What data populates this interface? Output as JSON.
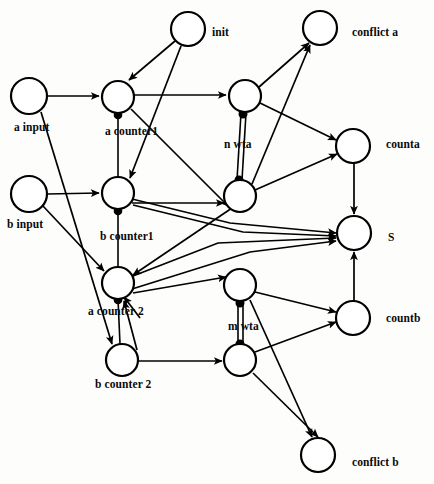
{
  "diagram": {
    "background_color": "#fdfdfb",
    "stroke_color": "#000000",
    "node_fill": "#ffffff",
    "nodes": [
      {
        "id": "a_input",
        "label": "a input",
        "cx": 29,
        "cy": 96,
        "r": 18,
        "label_x": 14,
        "label_y": 122
      },
      {
        "id": "b_input",
        "label": "b input",
        "cx": 29,
        "cy": 194,
        "r": 18,
        "label_x": 7,
        "label_y": 219
      },
      {
        "id": "init",
        "label": "init",
        "cx": 188,
        "cy": 29,
        "r": 17,
        "label_x": 212,
        "label_y": 27
      },
      {
        "id": "a_counter1",
        "label": "a counter1",
        "cx": 118,
        "cy": 97,
        "r": 16,
        "label_x": 105,
        "label_y": 126
      },
      {
        "id": "b_counter1",
        "label": "b counter1",
        "cx": 118,
        "cy": 193,
        "r": 16,
        "label_x": 100,
        "label_y": 231
      },
      {
        "id": "a_counter2",
        "label": "a counter 2",
        "cx": 118,
        "cy": 283,
        "r": 16,
        "label_x": 88,
        "label_y": 306
      },
      {
        "id": "b_counter2",
        "label": "b counter 2",
        "cx": 122,
        "cy": 360,
        "r": 16,
        "label_x": 95,
        "label_y": 379
      },
      {
        "id": "n_wta_top",
        "label": "n wta",
        "cx": 245,
        "cy": 96,
        "r": 16,
        "label_x": 224,
        "label_y": 139
      },
      {
        "id": "n_wta_bot",
        "label": "",
        "cx": 240,
        "cy": 196,
        "r": 16,
        "label_x": 0,
        "label_y": 0
      },
      {
        "id": "m_wta_top",
        "label": "m wta",
        "cx": 240,
        "cy": 285,
        "r": 16,
        "label_x": 228,
        "label_y": 321
      },
      {
        "id": "m_wta_bot",
        "label": "",
        "cx": 240,
        "cy": 360,
        "r": 16,
        "label_x": 0,
        "label_y": 0
      },
      {
        "id": "conflict_a",
        "label": "conflict a",
        "cx": 320,
        "cy": 28,
        "r": 17,
        "label_x": 352,
        "label_y": 27
      },
      {
        "id": "counta",
        "label": "counta",
        "cx": 353,
        "cy": 146,
        "r": 17,
        "label_x": 386,
        "label_y": 139
      },
      {
        "id": "S",
        "label": "S",
        "cx": 354,
        "cy": 233,
        "r": 17,
        "label_x": 388,
        "label_y": 232
      },
      {
        "id": "countb",
        "label": "countb",
        "cx": 353,
        "cy": 318,
        "r": 17,
        "label_x": 386,
        "label_y": 313
      },
      {
        "id": "conflict_b",
        "label": "conflict b",
        "cx": 318,
        "cy": 455,
        "r": 17,
        "label_x": 352,
        "label_y": 457
      }
    ],
    "edges": [
      {
        "from": "a_input",
        "to": "a_counter1",
        "type": "arrow"
      },
      {
        "from": "b_input",
        "to": "b_counter1",
        "type": "arrow"
      },
      {
        "from": "a_input",
        "to": "a_counter2",
        "type": "arrow"
      },
      {
        "from": "b_input",
        "to": "b_counter2",
        "type": "arrow"
      },
      {
        "from": "init",
        "to": "a_counter1",
        "type": "arrow"
      },
      {
        "from": "init",
        "to": "b_counter1",
        "type": "arrow"
      },
      {
        "from": "a_counter1",
        "to": "n_wta_top",
        "type": "arrow"
      },
      {
        "from": "b_counter1",
        "to": "a_counter2",
        "type": "arrow"
      },
      {
        "from": "b_counter2",
        "to": "m_wta_bot",
        "type": "arrow"
      },
      {
        "from": "b_counter2",
        "to": "a_counter2",
        "type": "arrow"
      },
      {
        "from": "a_counter2",
        "to": "m_wta_top",
        "type": "arrow"
      },
      {
        "from": "b_counter1",
        "to": "n_wta_bot",
        "type": "arrow"
      },
      {
        "from": "n_wta_top",
        "to": "conflict_a",
        "type": "arrow"
      },
      {
        "from": "n_wta_bot",
        "to": "conflict_a",
        "type": "arrow"
      },
      {
        "from": "n_wta_top",
        "to": "counta",
        "type": "arrow"
      },
      {
        "from": "n_wta_bot",
        "to": "counta",
        "type": "arrow"
      },
      {
        "from": "m_wta_top",
        "to": "countb",
        "type": "arrow"
      },
      {
        "from": "m_wta_bot",
        "to": "countb",
        "type": "arrow"
      },
      {
        "from": "m_wta_top",
        "to": "conflict_b",
        "type": "arrow"
      },
      {
        "from": "m_wta_bot",
        "to": "conflict_b",
        "type": "arrow"
      },
      {
        "from": "counta",
        "to": "S",
        "type": "arrow"
      },
      {
        "from": "countb",
        "to": "S",
        "type": "arrow"
      },
      {
        "from": "b_counter1",
        "to": "S",
        "type": "arrow"
      },
      {
        "from": "a_counter2",
        "to": "S",
        "type": "arrow"
      },
      {
        "from": "a_counter1",
        "to": "b_counter1",
        "type": "inhibitory"
      },
      {
        "from": "b_counter1",
        "to": "a_counter2",
        "type": "inhibitory"
      },
      {
        "from": "a_counter2",
        "to": "b_counter2",
        "type": "inhibitory"
      },
      {
        "from": "n_wta_top",
        "to": "n_wta_bot",
        "type": "inhibitory-pair"
      },
      {
        "from": "m_wta_top",
        "to": "m_wta_bot",
        "type": "inhibitory-pair"
      }
    ],
    "legend": {
      "arrow_meaning": "excitatory connection",
      "dot_meaning": "inhibitory connection"
    }
  }
}
